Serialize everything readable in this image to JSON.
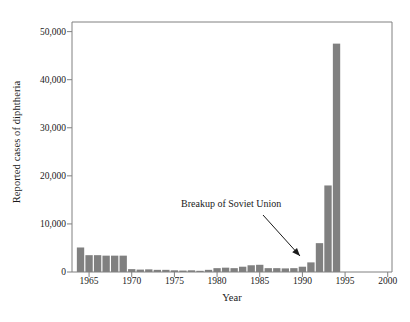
{
  "chart_data": {
    "type": "bar",
    "title": "",
    "xlabel": "Year",
    "ylabel": "Reported cases of diphtheria",
    "xlim": [
      1963.0,
      2000.5
    ],
    "ylim": [
      0,
      52000
    ],
    "grid": false,
    "legend": null,
    "bar_color": "#808080",
    "axis_color": "#808080",
    "text_color": "#1a1a1a",
    "xticks": [
      1965,
      1970,
      1975,
      1980,
      1985,
      1990,
      1995,
      2000
    ],
    "xtick_labels": [
      "1965",
      "1970",
      "1975",
      "1980",
      "1985",
      "1990",
      "1995",
      "2000"
    ],
    "yticks": [
      0,
      10000,
      20000,
      30000,
      40000,
      50000
    ],
    "ytick_labels": [
      "0",
      "10,000",
      "20,000",
      "30,000",
      "40,000",
      "50,000"
    ],
    "x": [
      1964,
      1965,
      1966,
      1967,
      1968,
      1969,
      1970,
      1971,
      1972,
      1973,
      1974,
      1975,
      1976,
      1977,
      1978,
      1979,
      1980,
      1981,
      1982,
      1983,
      1984,
      1985,
      1986,
      1987,
      1988,
      1989,
      1990,
      1991,
      1992,
      1993,
      1994
    ],
    "categories": [
      "1964",
      "1965",
      "1966",
      "1967",
      "1968",
      "1969",
      "1970",
      "1971",
      "1972",
      "1973",
      "1974",
      "1975",
      "1976",
      "1977",
      "1978",
      "1979",
      "1980",
      "1981",
      "1982",
      "1983",
      "1984",
      "1985",
      "1986",
      "1987",
      "1988",
      "1989",
      "1990",
      "1991",
      "1992",
      "1993",
      "1994"
    ],
    "values": [
      5100,
      3500,
      3500,
      3400,
      3400,
      3400,
      600,
      500,
      550,
      450,
      450,
      350,
      300,
      350,
      250,
      450,
      800,
      900,
      800,
      1100,
      1400,
      1500,
      800,
      800,
      750,
      800,
      1100,
      2000,
      6000,
      18000,
      47500
    ],
    "annotations": [
      {
        "text": "Breakup of Soviet Union",
        "text_x": 181,
        "text_y": 198,
        "arrow_from": [
          263,
          215
        ],
        "arrow_to": [
          300,
          256
        ],
        "points_to_year": 1990
      }
    ]
  },
  "figure": {
    "plot_left": 72,
    "plot_right": 392,
    "plot_top": 22,
    "plot_bottom": 272
  }
}
